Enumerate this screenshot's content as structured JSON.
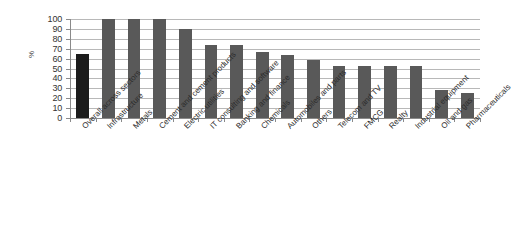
{
  "chart_data": {
    "type": "bar",
    "title": "",
    "xlabel": "",
    "ylabel": "%",
    "ylim": [
      0,
      100
    ],
    "yticks": [
      0,
      10,
      20,
      30,
      40,
      50,
      60,
      70,
      80,
      90,
      100
    ],
    "grid": true,
    "legend": false,
    "categories": [
      "Overall across sectors",
      "Infrastructure",
      "Metals",
      "Cement and cement products",
      "Electric utilities",
      "IT consulting and software",
      "Banking and finance",
      "Chemicals",
      "Automobiles and parts",
      "Others",
      "Telecom and TV",
      "FMCG",
      "Realty",
      "Industrial equipment",
      "Oil and gas",
      "Pharmaceuticals"
    ],
    "values": [
      65,
      100,
      100,
      100,
      90,
      74,
      74,
      67,
      64,
      59,
      53,
      53,
      53,
      53,
      28,
      25
    ],
    "bar_colors": [
      "#1c1c1c",
      "#595959",
      "#595959",
      "#595959",
      "#595959",
      "#595959",
      "#595959",
      "#595959",
      "#595959",
      "#595959",
      "#595959",
      "#595959",
      "#595959",
      "#595959",
      "#595959",
      "#595959"
    ],
    "highlight_index": 0,
    "colors": {
      "bar": "#595959",
      "highlight_bar": "#1c1c1c",
      "gridline": "#b8b8b8",
      "axis": "#8a8a8a",
      "text": "#2b2b2b",
      "background": "#ffffff"
    }
  }
}
